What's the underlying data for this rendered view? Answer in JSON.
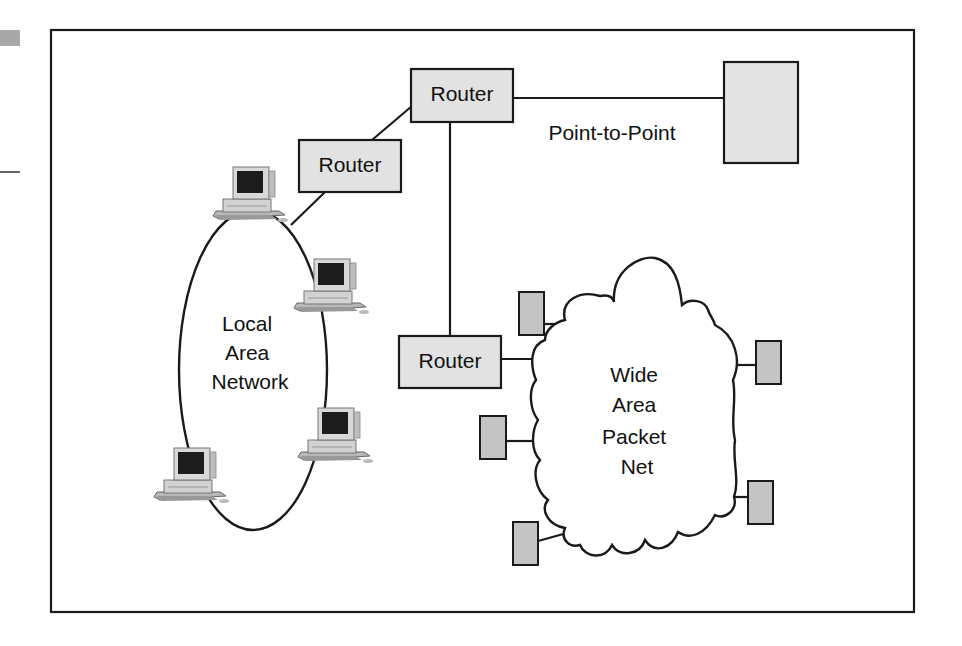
{
  "diagram": {
    "title": "",
    "colors": {
      "stroke": "#1a1a1a",
      "router_fill": "#e2e2e2",
      "endpoint_fill": "#e4e4e4",
      "wan_device_fill": "#c4c4c4",
      "margin_tab": "#a8a8a8",
      "background": "#ffffff"
    },
    "routers": [
      {
        "id": "router-top",
        "label": "Router"
      },
      {
        "id": "router-left",
        "label": "Router"
      },
      {
        "id": "router-bottom",
        "label": "Router"
      }
    ],
    "point_to_point": {
      "label": "Point-to-Point",
      "endpoint": "remote-host"
    },
    "lan": {
      "label_lines": [
        "Local",
        "Area",
        "Network"
      ],
      "computers": 4
    },
    "wan": {
      "label_lines": [
        "Wide",
        "Area",
        "Packet",
        "Net"
      ],
      "attached_devices": 6
    },
    "edges": [
      {
        "from": "router-left",
        "to": "router-top"
      },
      {
        "from": "router-left",
        "to": "lan"
      },
      {
        "from": "router-top",
        "to": "remote-host",
        "label": "Point-to-Point"
      },
      {
        "from": "router-top",
        "to": "router-bottom"
      },
      {
        "from": "router-bottom",
        "to": "wan"
      }
    ]
  }
}
